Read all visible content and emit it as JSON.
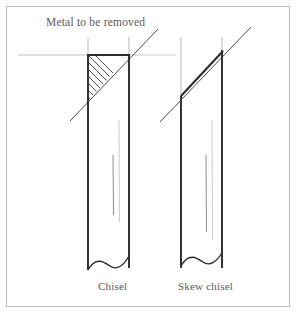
{
  "figure": {
    "title_label": "Metal to be removed",
    "background_color": "#ffffff",
    "frame_color": "#b9b9b9",
    "ink_color": "#2b2b2b",
    "text_color": "#5a5a5a",
    "guide_color": "#b0b0b0",
    "faint_color": "#cccccc",
    "width": 298,
    "height": 315
  },
  "diagram": {
    "type": "technical-line-drawing",
    "reference_line": {
      "name": "metal-to-be-removed-level",
      "y": 55,
      "x_start": 18,
      "x_end": 175
    },
    "tools": [
      {
        "id": "chisel",
        "caption": "Chisel",
        "blade_left_x": 88,
        "blade_right_x": 129,
        "blade_top_y": 55,
        "blade_bottom_y": 270,
        "bevel": {
          "type": "symmetric-straight",
          "hatched": true,
          "hatch_spacing": 7,
          "waste_triangle": [
            [
              88,
              55
            ],
            [
              129,
              55
            ],
            [
              88,
              101
            ]
          ]
        },
        "grind_line": {
          "x1": 70,
          "y1": 120,
          "x2": 158,
          "y2": 30
        },
        "stub_marks": [
          {
            "x": 88,
            "y_top": 37,
            "y_bottom": 55
          },
          {
            "x": 129,
            "y_top": 37,
            "y_bottom": 55
          }
        ],
        "shading_lines": [
          {
            "x": 119,
            "y_top": 120,
            "y_bottom": 222
          },
          {
            "x": 113,
            "y_top": 155,
            "y_bottom": 215
          }
        ],
        "break_line": "wavy"
      },
      {
        "id": "skew-chisel",
        "caption": "Skew chisel",
        "blade_left_x": 181,
        "blade_right_x": 222,
        "blade_top_y": 96,
        "blade_bottom_y": 270,
        "bevel": {
          "type": "skew-angled",
          "hatched": false,
          "edge": [
            [
              181,
              96
            ],
            [
              222,
              50
            ]
          ]
        },
        "grind_line": {
          "x1": 160,
          "y1": 120,
          "x2": 250,
          "y2": 28
        },
        "stub_marks": [
          {
            "x": 181,
            "y_top": 37,
            "y_bottom": 96
          },
          {
            "x": 222,
            "y_top": 37,
            "y_bottom": 50
          }
        ],
        "shading_lines": [
          {
            "x": 212,
            "y_top": 120,
            "y_bottom": 240
          },
          {
            "x": 206,
            "y_top": 155,
            "y_bottom": 232
          }
        ],
        "break_line": "wavy"
      }
    ]
  }
}
